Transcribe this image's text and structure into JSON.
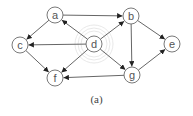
{
  "diagram": {
    "caption": "(a)",
    "colors": {
      "node_stroke": "#6a6a6a",
      "edge": "#555555",
      "label": "#555555",
      "highlight_ring": "#e2e2e2"
    },
    "nodes": [
      {
        "id": "a",
        "label": "a",
        "x": 55,
        "y": 15
      },
      {
        "id": "b",
        "label": "b",
        "x": 131,
        "y": 16
      },
      {
        "id": "c",
        "label": "c",
        "x": 20,
        "y": 45
      },
      {
        "id": "d",
        "label": "d",
        "x": 94,
        "y": 44
      },
      {
        "id": "e",
        "label": "e",
        "x": 172,
        "y": 44
      },
      {
        "id": "f",
        "label": "f",
        "x": 55,
        "y": 78
      },
      {
        "id": "g",
        "label": "g",
        "x": 132,
        "y": 75
      }
    ],
    "edges": [
      {
        "from": "a",
        "to": "b"
      },
      {
        "from": "a",
        "to": "c"
      },
      {
        "from": "d",
        "to": "a"
      },
      {
        "from": "d",
        "to": "b"
      },
      {
        "from": "d",
        "to": "c"
      },
      {
        "from": "d",
        "to": "f"
      },
      {
        "from": "d",
        "to": "g"
      },
      {
        "from": "c",
        "to": "f"
      },
      {
        "from": "b",
        "to": "g"
      },
      {
        "from": "b",
        "to": "e"
      },
      {
        "from": "g",
        "to": "e"
      },
      {
        "from": "g",
        "to": "f"
      }
    ],
    "highlighted_node": "d"
  }
}
